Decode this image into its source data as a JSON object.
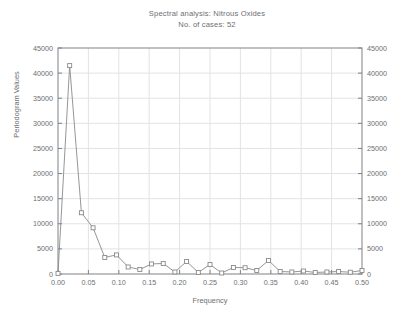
{
  "chart_data": {
    "type": "line",
    "title": "Spectral analysis: Nitrous Oxides",
    "subtitle": "No. of cases: 52",
    "xlabel": "Frequency",
    "ylabel": "Periodogram Values",
    "ylabel_right": "Periodogram Values",
    "xlim": [
      0.0,
      0.5
    ],
    "ylim": [
      0,
      45000
    ],
    "grid": true,
    "legend": null,
    "marker": "open-square",
    "line_color": "#8a8a8a",
    "marker_color": "#8a8a8a",
    "xticks": [
      "0.00",
      "0.05",
      "0.10",
      "0.15",
      "0.20",
      "0.25",
      "0.30",
      "0.35",
      "0.40",
      "0.45",
      "0.50"
    ],
    "xtick_values": [
      0.0,
      0.05,
      0.1,
      0.15,
      0.2,
      0.25,
      0.3,
      0.35,
      0.4,
      0.45,
      0.5
    ],
    "yticks": [
      "0",
      "5000",
      "10000",
      "15000",
      "20000",
      "25000",
      "30000",
      "35000",
      "40000",
      "45000"
    ],
    "ytick_values": [
      0,
      5000,
      10000,
      15000,
      20000,
      25000,
      30000,
      35000,
      40000,
      45000
    ],
    "yticks_right": [
      "0",
      "5000",
      "10000",
      "15000",
      "20000",
      "25000",
      "30000",
      "35000",
      "40000",
      "45000"
    ],
    "series": [
      {
        "name": "Periodogram",
        "x": [
          0.0,
          0.0192,
          0.0385,
          0.0577,
          0.0769,
          0.0962,
          0.1154,
          0.1346,
          0.1538,
          0.1731,
          0.1923,
          0.2115,
          0.2308,
          0.25,
          0.2692,
          0.2885,
          0.3077,
          0.3269,
          0.3462,
          0.3654,
          0.3846,
          0.4038,
          0.4231,
          0.4423,
          0.4615,
          0.4808,
          0.5
        ],
        "y": [
          120,
          41500,
          12200,
          9200,
          3300,
          3800,
          1400,
          900,
          2000,
          2100,
          400,
          2500,
          300,
          1900,
          200,
          1300,
          1250,
          700,
          2700,
          500,
          400,
          600,
          300,
          400,
          500,
          350,
          700
        ]
      }
    ]
  },
  "axis_style": {
    "frame_color": "#808184",
    "grid_color": "#e3e3e3",
    "background": "#ffffff"
  }
}
